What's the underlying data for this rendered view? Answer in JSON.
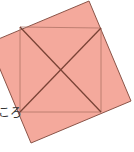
{
  "diagram": {
    "label_text": "ころ",
    "colors": {
      "fill": "#f4a99c",
      "outer_stroke": "#8a5448",
      "inner_stroke": "#b07466",
      "diagonal_stroke": "#7a4336"
    },
    "outer_square": [
      [
        89,
        1
      ],
      [
        131,
        101
      ],
      [
        31,
        143
      ],
      [
        -11,
        43
      ]
    ],
    "inner_square": [
      [
        20,
        27
      ],
      [
        101,
        28
      ],
      [
        101,
        112
      ],
      [
        20,
        112
      ]
    ],
    "diagonals": [
      [
        [
          20,
          27
        ],
        [
          101,
          112
        ]
      ],
      [
        [
          101,
          28
        ],
        [
          20,
          112
        ]
      ]
    ]
  }
}
